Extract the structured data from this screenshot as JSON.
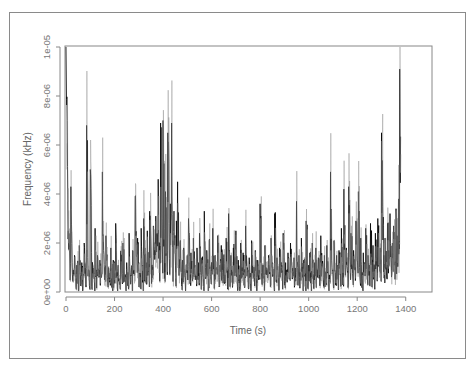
{
  "chart_data": {
    "type": "line",
    "title": "",
    "xlabel": "Time (s)",
    "ylabel": "Frequency (kHz)",
    "xlim": [
      0,
      1500
    ],
    "ylim": [
      0,
      1e-05
    ],
    "x_ticks": [
      0,
      200,
      400,
      600,
      800,
      1000,
      1200,
      1400
    ],
    "x_tick_labels": [
      "0",
      "200",
      "400",
      "600",
      "800",
      "1000",
      "1200",
      "1400"
    ],
    "y_ticks": [
      0,
      2e-06,
      4e-06,
      6e-06,
      8e-06,
      1e-05
    ],
    "y_tick_labels": [
      "0e+00",
      "2e-06",
      "4e-06",
      "6e-06",
      "8e-06",
      "1e-05"
    ],
    "grid": false,
    "legend": null,
    "series": [
      {
        "name": "frequency",
        "color": "#000000",
        "y_scale": 1e-06,
        "x_step": 5,
        "x_start": 0,
        "values_e6": [
          10.0,
          7.0,
          2.5,
          1.8,
          4.3,
          1.2,
          0.9,
          1.5,
          0.6,
          1.1,
          0.8,
          1.9,
          0.7,
          1.2,
          0.5,
          2.0,
          0.9,
          6.8,
          1.4,
          0.8,
          5.0,
          1.6,
          1.1,
          0.7,
          2.6,
          0.9,
          1.5,
          0.6,
          1.3,
          0.8,
          4.9,
          1.7,
          1.0,
          2.3,
          0.6,
          1.0,
          0.4,
          1.8,
          0.9,
          1.3,
          0.5,
          2.8,
          0.8,
          1.1,
          0.3,
          1.6,
          0.7,
          2.0,
          0.9,
          0.5,
          1.2,
          0.8,
          2.4,
          0.6,
          1.0,
          1.7,
          0.9,
          3.9,
          1.5,
          2.2,
          1.2,
          0.7,
          2.6,
          1.0,
          3.0,
          1.8,
          1.2,
          2.5,
          1.4,
          3.3,
          2.0,
          1.1,
          2.7,
          1.7,
          3.1,
          2.4,
          4.6,
          2.0,
          6.9,
          3.0,
          7.0,
          2.6,
          4.1,
          2.2,
          6.5,
          2.8,
          3.6,
          6.9,
          2.1,
          3.3,
          1.6,
          2.9,
          4.5,
          1.4,
          2.0,
          0.8,
          1.3,
          1.8,
          0.6,
          1.1,
          1.5,
          3.0,
          0.9,
          1.6,
          0.7,
          2.2,
          1.0,
          0.5,
          1.8,
          1.2,
          2.4,
          0.8,
          1.4,
          0.6,
          3.3,
          1.0,
          1.7,
          0.9,
          2.1,
          0.7,
          1.2,
          2.6,
          0.8,
          1.5,
          1.0,
          2.3,
          0.6,
          1.1,
          1.9,
          0.8,
          1.4,
          0.7,
          2.2,
          1.0,
          3.2,
          0.9,
          1.5,
          0.6,
          1.8,
          1.1,
          2.5,
          0.8,
          1.3,
          0.7,
          2.0,
          1.0,
          1.6,
          0.6,
          2.7,
          1.2,
          0.9,
          1.4,
          0.5,
          2.1,
          0.8,
          1.0,
          1.7,
          0.6,
          1.3,
          0.9,
          3.6,
          0.8,
          1.1,
          0.7,
          1.9,
          1.0,
          0.6,
          1.5,
          0.8,
          2.2,
          1.2,
          0.7,
          3.2,
          0.9,
          1.4,
          0.6,
          1.8,
          1.1,
          0.8,
          2.4,
          0.7,
          1.2,
          0.9,
          1.6,
          0.6,
          2.0,
          1.1,
          0.8,
          1.4,
          0.7,
          3.7,
          1.0,
          1.5,
          0.8,
          2.2,
          0.6,
          1.3,
          0.9,
          2.9,
          0.7,
          1.1,
          1.6,
          0.8,
          2.0,
          0.6,
          1.2,
          1.8,
          0.9,
          1.4,
          0.7,
          2.3,
          1.0,
          0.6,
          1.5,
          0.8,
          1.9,
          1.1,
          0.7,
          4.9,
          1.3,
          0.9,
          2.1,
          0.8,
          1.5,
          1.0,
          1.7,
          0.7,
          2.6,
          1.2,
          4.2,
          1.0,
          1.8,
          0.8,
          4.3,
          1.4,
          2.4,
          1.1,
          1.7,
          0.9,
          2.9,
          1.3,
          4.1,
          1.0,
          2.2,
          0.8,
          1.6,
          1.2,
          2.6,
          0.9,
          1.5,
          1.1,
          2.8,
          1.3,
          1.9,
          1.0,
          2.4,
          1.4,
          3.0,
          1.2,
          1.8,
          6.5,
          3.5,
          1.5,
          2.2,
          1.1,
          2.8,
          1.7,
          3.2,
          1.3,
          2.0,
          2.7,
          1.6,
          3.4,
          2.3,
          3.8,
          9.1
        ],
        "peaks_notable": [
          {
            "x": 0,
            "y": 1e-05
          },
          {
            "x": 85,
            "y": 6.8e-06
          },
          {
            "x": 400,
            "y": 7e-06
          },
          {
            "x": 435,
            "y": 6.9e-06
          },
          {
            "x": 1010,
            "y": 3.7e-06
          },
          {
            "x": 1165,
            "y": 4.9e-06
          },
          {
            "x": 1410,
            "y": 6.5e-06
          },
          {
            "x": 1500,
            "y": 9.1e-06
          }
        ]
      }
    ]
  }
}
